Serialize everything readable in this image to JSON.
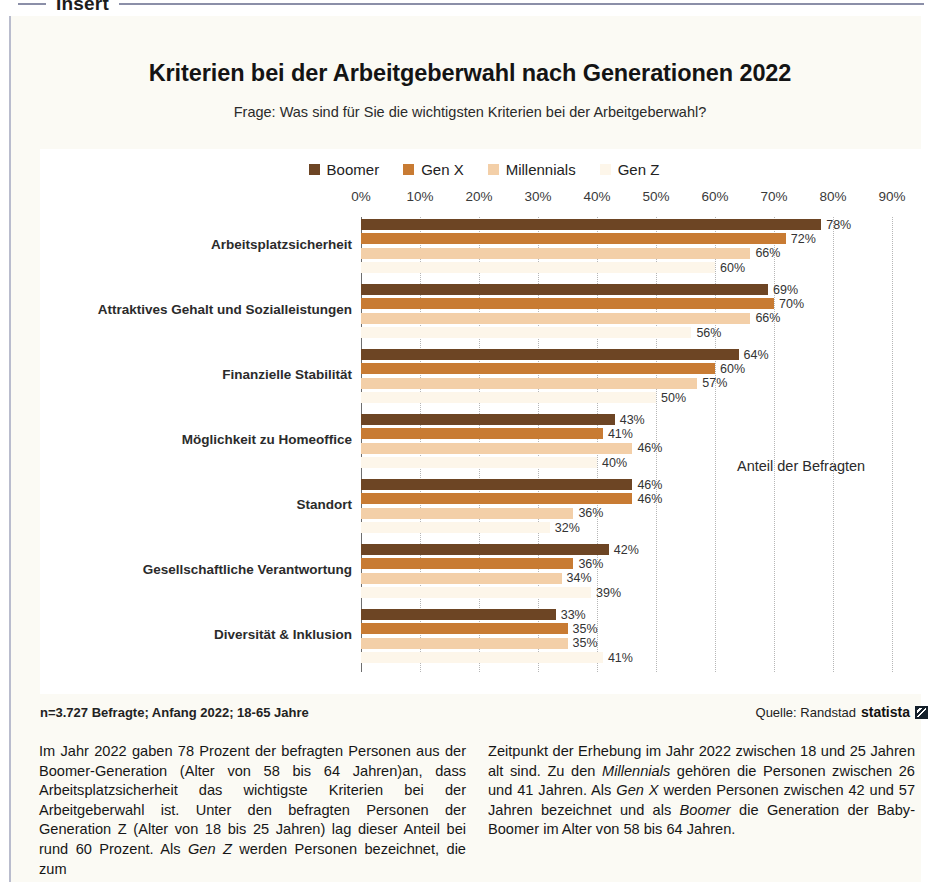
{
  "section_header": {
    "label": "Insert"
  },
  "header": {
    "title": "Kriterien bei der Arbeitgeberwahl nach Generationen 2022",
    "subtitle": "Frage: Was sind für Sie die wichtigsten Kriterien bei der Arbeitgeberwahl?"
  },
  "annotation": {
    "axis_note": "Anteil der Befragten"
  },
  "footer": {
    "note": "n=3.727 Befragte; Anfang 2022; 18-65 Jahre",
    "source_label": "Quelle: Randstad",
    "brand": "statista",
    "brand_mark": "statista-logo-icon"
  },
  "body": {
    "left_column_html": "Im Jahr 2022 gaben 78 Prozent der befragten Personen aus der Boomer-Generation (Alter von 58 bis 64 Jahren)an, dass Arbeitsplatzsicherheit das wichtigste Kriterien bei der Arbeitgeberwahl ist. Unter den befragten Personen der Generation Z (Alter von 18 bis 25 Jahren) lag dieser Anteil bei rund 60 Prozent. Als <i>Gen Z</i> werden Personen bezeichnet, die zum",
    "right_column_html": "Zeitpunkt der Erhebung im Jahr 2022 zwischen 18 und 25 Jahren alt sind. Zu den <i>Millennials</i> gehören die Personen zwischen 26 und 41 Jahren. Als <i>Gen X</i> werden Personen zwischen 42 und 57 Jahren bezeichnet und als <i>Boomer</i> die Generation der Baby-Boomer im Alter von 58 bis 64 Jahren."
  },
  "colors": {
    "boomer": "#6d4524",
    "gen_x": "#c87b33",
    "millennials": "#f3cfa8",
    "gen_z": "#fdf6ea",
    "panel": "#ffffff",
    "page": "#fbfaf4",
    "gridline": "#b6b6b6",
    "axis": "#6e6e6e"
  },
  "chart_data": {
    "type": "bar",
    "orientation": "horizontal",
    "title": "Kriterien bei der Arbeitgeberwahl nach Generationen 2022",
    "subtitle": "Frage: Was sind für Sie die wichtigsten Kriterien bei der Arbeitgeberwahl?",
    "xlabel": "Anteil der Befragten",
    "ylabel": "",
    "xlim": [
      0,
      90
    ],
    "grid": true,
    "grid_axis": "x",
    "legend_position": "top-center",
    "tick_labels": [
      "0%",
      "10%",
      "20%",
      "30%",
      "40%",
      "50%",
      "60%",
      "70%",
      "80%",
      "90%"
    ],
    "tick_values": [
      0,
      10,
      20,
      30,
      40,
      50,
      60,
      70,
      80,
      90
    ],
    "categories": [
      "Arbeitsplatzsicherheit",
      "Attraktives Gehalt und Sozialleistungen",
      "Finanzielle Stabilität",
      "Möglichkeit zu Homeoffice",
      "Standort",
      "Gesellschaftliche Verantwortung",
      "Diversität & Inklusion"
    ],
    "series": [
      {
        "name": "Boomer",
        "color": "#6d4524",
        "values": [
          78,
          69,
          64,
          43,
          46,
          42,
          33
        ],
        "labels": [
          "78%",
          "69%",
          "64%",
          "43%",
          "46%",
          "42%",
          "33%"
        ]
      },
      {
        "name": "Gen X",
        "color": "#c87b33",
        "values": [
          72,
          70,
          60,
          41,
          46,
          36,
          35
        ],
        "labels": [
          "72%",
          "70%",
          "60%",
          "41%",
          "46%",
          "36%",
          "35%"
        ]
      },
      {
        "name": "Millennials",
        "color": "#f3cfa8",
        "values": [
          66,
          66,
          57,
          46,
          36,
          34,
          35
        ],
        "labels": [
          "66%",
          "66%",
          "57%",
          "46%",
          "36%",
          "34%",
          "35%"
        ]
      },
      {
        "name": "Gen Z",
        "color": "#fdf6ea",
        "values": [
          60,
          56,
          50,
          40,
          32,
          39,
          41
        ],
        "labels": [
          "60%",
          "56%",
          "50%",
          "40%",
          "32%",
          "39%",
          "41%"
        ]
      }
    ]
  }
}
